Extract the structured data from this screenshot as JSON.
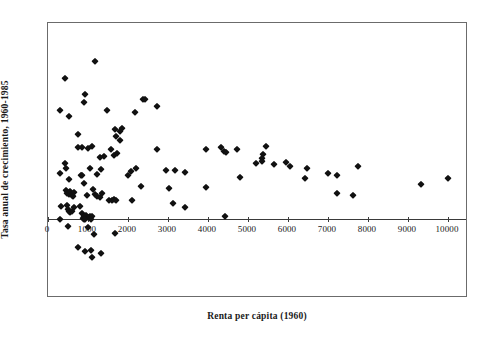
{
  "chart_data": {
    "type": "scatter",
    "title": "",
    "xlabel": "Renta per cápita (1960)",
    "ylabel": "Tasa anual de crecimiento, 1960-1985",
    "xlim": [
      0,
      10500
    ],
    "ylim": [
      -4,
      10
    ],
    "xticks": [
      0,
      1000,
      2000,
      3000,
      4000,
      5000,
      6000,
      7000,
      8000,
      9000,
      10000
    ],
    "xtick_labels": [
      "0",
      "1000",
      "2000",
      "3000",
      "4000",
      "5000",
      "6000",
      "7000",
      "8000",
      "9000",
      "10000"
    ],
    "yticks": [
      -4,
      -2,
      0,
      2,
      4,
      6,
      8,
      10
    ],
    "ytick_labels": [
      "-4",
      "-2",
      "0",
      "2",
      "4",
      "6",
      "8",
      "10"
    ],
    "grid": false,
    "legend": null,
    "marker": "diamond",
    "marker_color": "#111111",
    "frame_color": "#6b6b6b",
    "background": "#ffffff",
    "series": [
      {
        "name": "países",
        "points": [
          [
            1180,
            8.05
          ],
          [
            430,
            7.2
          ],
          [
            930,
            6.4
          ],
          [
            900,
            6.0
          ],
          [
            2380,
            6.15
          ],
          [
            2430,
            6.12
          ],
          [
            2720,
            5.8
          ],
          [
            300,
            5.55
          ],
          [
            1470,
            5.55
          ],
          [
            2180,
            5.45
          ],
          [
            520,
            5.25
          ],
          [
            1670,
            4.6
          ],
          [
            1860,
            4.65
          ],
          [
            1800,
            4.5
          ],
          [
            740,
            4.35
          ],
          [
            1700,
            4.25
          ],
          [
            1790,
            4.05
          ],
          [
            1110,
            3.75
          ],
          [
            750,
            3.7
          ],
          [
            840,
            3.7
          ],
          [
            1000,
            3.65
          ],
          [
            1570,
            3.6
          ],
          [
            2720,
            3.6
          ],
          [
            3940,
            3.6
          ],
          [
            4730,
            3.6
          ],
          [
            4330,
            3.7
          ],
          [
            4410,
            3.5
          ],
          [
            4450,
            3.45
          ],
          [
            5440,
            3.75
          ],
          [
            5370,
            3.35
          ],
          [
            5340,
            3.15
          ],
          [
            1650,
            3.3
          ],
          [
            1720,
            3.4
          ],
          [
            1390,
            3.25
          ],
          [
            1310,
            3.2
          ],
          [
            5210,
            2.85
          ],
          [
            5360,
            2.95
          ],
          [
            5640,
            2.8
          ],
          [
            5950,
            2.9
          ],
          [
            6040,
            2.7
          ],
          [
            6480,
            2.6
          ],
          [
            7760,
            2.7
          ],
          [
            7010,
            2.35
          ],
          [
            7230,
            2.25
          ],
          [
            6420,
            2.1
          ],
          [
            4790,
            2.15
          ],
          [
            10000,
            2.1
          ],
          [
            9330,
            1.8
          ],
          [
            7230,
            1.35
          ],
          [
            7630,
            1.25
          ],
          [
            295,
            2.35
          ],
          [
            430,
            2.85
          ],
          [
            455,
            2.6
          ],
          [
            515,
            2.05
          ],
          [
            820,
            2.25
          ],
          [
            840,
            2.25
          ],
          [
            1060,
            2.6
          ],
          [
            1220,
            2.3
          ],
          [
            1320,
            2.55
          ],
          [
            2000,
            2.25
          ],
          [
            2080,
            2.45
          ],
          [
            2200,
            2.6
          ],
          [
            2960,
            2.5
          ],
          [
            3180,
            2.5
          ],
          [
            3420,
            2.4
          ],
          [
            440,
            1.5
          ],
          [
            480,
            1.35
          ],
          [
            520,
            1.3
          ],
          [
            560,
            1.45
          ],
          [
            600,
            1.25
          ],
          [
            620,
            1.2
          ],
          [
            640,
            1.4
          ],
          [
            905,
            1.85
          ],
          [
            970,
            1.25
          ],
          [
            1120,
            1.55
          ],
          [
            1180,
            1.3
          ],
          [
            1230,
            1.2
          ],
          [
            1300,
            1.15
          ],
          [
            1350,
            1.35
          ],
          [
            2320,
            1.7
          ],
          [
            3030,
            1.6
          ],
          [
            3960,
            1.65
          ],
          [
            1520,
            1.0
          ],
          [
            1600,
            1.0
          ],
          [
            1660,
            1.05
          ],
          [
            1710,
            1.0
          ],
          [
            2090,
            1.0
          ],
          [
            3130,
            0.85
          ],
          [
            3420,
            0.65
          ],
          [
            330,
            0.7
          ],
          [
            470,
            0.75
          ],
          [
            490,
            0.55
          ],
          [
            520,
            0.45
          ],
          [
            560,
            0.4
          ],
          [
            590,
            0.45
          ],
          [
            640,
            0.65
          ],
          [
            790,
            0.7
          ],
          [
            860,
            0.35
          ],
          [
            890,
            0.2
          ],
          [
            920,
            0.15
          ],
          [
            950,
            0.25
          ],
          [
            1000,
            0.1
          ],
          [
            1060,
            0.2
          ],
          [
            1100,
            0.15
          ],
          [
            4430,
            0.15
          ],
          [
            300,
            0.0
          ],
          [
            880,
            0.05
          ],
          [
            905,
            0.02
          ],
          [
            930,
            0.0
          ],
          [
            1080,
            0.0
          ],
          [
            510,
            -0.35
          ],
          [
            1010,
            -0.4
          ],
          [
            1140,
            -0.75
          ],
          [
            1670,
            -0.7
          ],
          [
            740,
            -1.4
          ],
          [
            930,
            -1.6
          ],
          [
            1070,
            -1.55
          ],
          [
            1330,
            -1.7
          ],
          [
            1100,
            -1.9
          ]
        ]
      }
    ]
  },
  "axes": {
    "y_title": "Tasa anual de crecimiento, 1960-1985",
    "x_title": "Renta per cápita (1960)"
  }
}
